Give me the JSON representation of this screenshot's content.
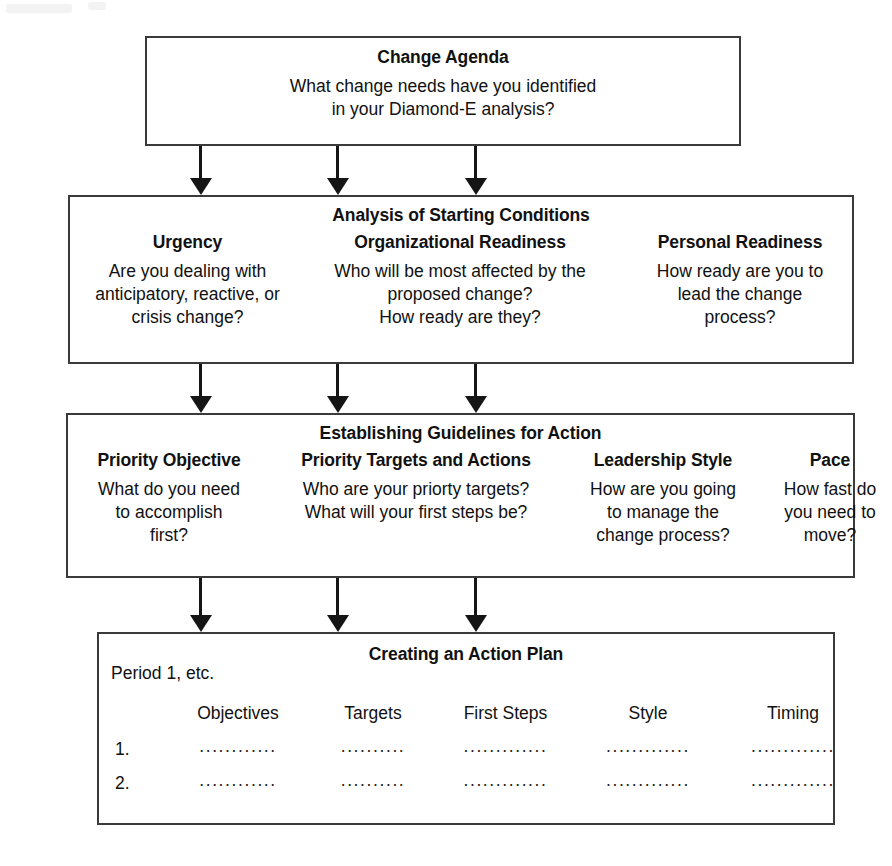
{
  "diagram": {
    "title_alt": "Change management planning flowchart",
    "stroke_color": "#3a3a3a",
    "arrow_color": "#151515",
    "background": "#ffffff"
  },
  "change_agenda": {
    "title": "Change Agenda",
    "line1": "What change needs have you identified",
    "line2": "in your Diamond-E analysis?"
  },
  "starting_conditions": {
    "title": "Analysis of Starting Conditions",
    "columns": [
      {
        "heading": "Urgency",
        "lines": [
          "Are you dealing with",
          "anticipatory, reactive, or",
          "crisis change?"
        ]
      },
      {
        "heading": "Organizational Readiness",
        "lines": [
          "Who will be most affected by the",
          "proposed change?",
          "How ready are they?"
        ]
      },
      {
        "heading": "Personal Readiness",
        "lines": [
          "How ready are you to",
          "lead the change",
          "process?"
        ]
      }
    ]
  },
  "guidelines": {
    "title": "Establishing Guidelines for Action",
    "columns": [
      {
        "heading": "Priority Objective",
        "lines": [
          "What do you need",
          "to accomplish",
          "first?"
        ]
      },
      {
        "heading": "Priority Targets and Actions",
        "lines": [
          "Who are your priorty targets?",
          "What will your first steps be?"
        ]
      },
      {
        "heading": "Leadership Style",
        "lines": [
          "How are you going",
          "to manage the",
          "change process?"
        ]
      },
      {
        "heading": "Pace",
        "lines": [
          "How fast do",
          "you need to",
          "move?"
        ]
      }
    ]
  },
  "action_plan": {
    "title": "Creating an Action Plan",
    "period_label": "Period 1, etc.",
    "table": {
      "corner": "",
      "headers": [
        "Objectives",
        "Targets",
        "First Steps",
        "Style",
        "Timing"
      ],
      "rows": [
        {
          "number": "1.",
          "cells": [
            "............",
            "..........",
            ".............",
            ".............",
            "............."
          ]
        },
        {
          "number": "2.",
          "cells": [
            "............",
            "..........",
            ".............",
            ".............",
            "............."
          ]
        }
      ]
    }
  },
  "arrows": {
    "group1": [
      {
        "name": "arrow-agenda-to-urgency",
        "x": 190,
        "top": 146,
        "length": 49
      },
      {
        "name": "arrow-agenda-to-org-readiness",
        "x": 327,
        "top": 146,
        "length": 49
      },
      {
        "name": "arrow-agenda-to-personal-readiness",
        "x": 465,
        "top": 146,
        "length": 49
      }
    ],
    "group2": [
      {
        "name": "arrow-conditions-to-priority-objective",
        "x": 190,
        "top": 364,
        "length": 49
      },
      {
        "name": "arrow-conditions-to-priority-targets",
        "x": 327,
        "top": 364,
        "length": 49
      },
      {
        "name": "arrow-conditions-to-leadership-style",
        "x": 465,
        "top": 364,
        "length": 49
      }
    ],
    "group3": [
      {
        "name": "arrow-guidelines-to-objectives",
        "x": 190,
        "top": 578,
        "length": 54
      },
      {
        "name": "arrow-guidelines-to-targets",
        "x": 327,
        "top": 578,
        "length": 54
      },
      {
        "name": "arrow-guidelines-to-first-steps",
        "x": 465,
        "top": 578,
        "length": 54
      }
    ]
  }
}
